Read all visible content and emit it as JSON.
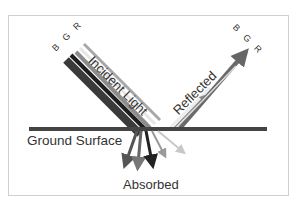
{
  "diagram": {
    "labels": {
      "incident": "Incident Light",
      "reflected": "Reflected",
      "ground": "Ground Surface",
      "absorbed": "Absorbed",
      "bands_incident": "B G R",
      "bands_reflected": "B G R"
    },
    "bands": [
      {
        "name": "B",
        "incident_color": "#2a2a2a",
        "reflected_color": "#e8e8e8"
      },
      {
        "name": "G",
        "incident_color": "#8a8a8a",
        "reflected_color": "#9a9a9a"
      },
      {
        "name": "R",
        "incident_color": "#b8b8b8",
        "reflected_color": "#6a6a6a"
      }
    ],
    "colors": {
      "ground_line": "#444444",
      "frame_border": "#cfcfcf",
      "text": "#333333"
    }
  }
}
